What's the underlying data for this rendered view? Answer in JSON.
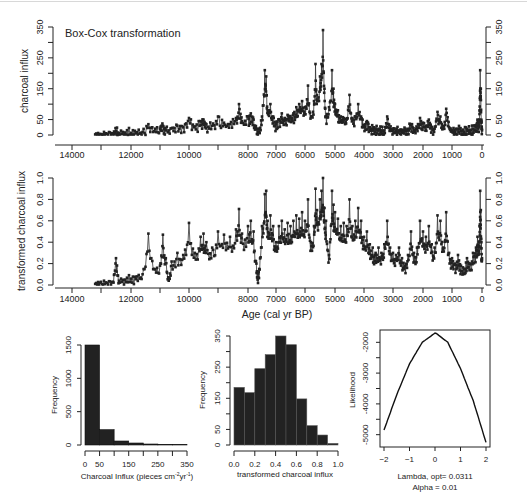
{
  "figure": {
    "title": "Box-Cox transformation"
  },
  "chart_data": [
    {
      "id": "raw-series",
      "type": "line",
      "title": "Box-Cox transformation",
      "xlabel": "",
      "ylabel": "charcoal influx",
      "xlim": [
        14500,
        0
      ],
      "ylim": [
        0,
        350
      ],
      "x_ticks": [
        14000,
        13000,
        12000,
        11000,
        10000,
        9000,
        8000,
        7000,
        6000,
        5000,
        4000,
        3000,
        2000,
        1000,
        0
      ],
      "x_tick_labels": [
        "14000",
        "12000",
        "10000",
        "8000",
        "7000",
        "6000",
        "5000",
        "4000",
        "3000",
        "2000",
        "1000",
        "0"
      ],
      "y_ticks": [
        0,
        50,
        100,
        150,
        200,
        250,
        300,
        350
      ],
      "y_tick_labels": [
        "0",
        "50",
        "150",
        "250",
        "350"
      ],
      "right_axis": true,
      "series": [
        {
          "name": "charcoal influx",
          "x": [
            13200,
            13000,
            12800,
            12600,
            12500,
            12400,
            12200,
            12000,
            11800,
            11600,
            11400,
            11200,
            11000,
            10900,
            10800,
            10600,
            10400,
            10200,
            10000,
            9800,
            9600,
            9500,
            9400,
            9200,
            9000,
            8800,
            8600,
            8400,
            8300,
            8200,
            8000,
            7900,
            7800,
            7700,
            7600,
            7500,
            7400,
            7350,
            7300,
            7200,
            7100,
            7000,
            6900,
            6800,
            6700,
            6600,
            6500,
            6400,
            6300,
            6200,
            6100,
            6000,
            5900,
            5800,
            5700,
            5650,
            5600,
            5500,
            5450,
            5400,
            5350,
            5300,
            5200,
            5100,
            5050,
            5000,
            4900,
            4800,
            4700,
            4600,
            4500,
            4400,
            4300,
            4200,
            4100,
            4000,
            3900,
            3800,
            3700,
            3600,
            3500,
            3400,
            3300,
            3200,
            3100,
            3000,
            2900,
            2800,
            2700,
            2600,
            2500,
            2400,
            2300,
            2200,
            2100,
            2000,
            1900,
            1800,
            1700,
            1600,
            1500,
            1400,
            1300,
            1200,
            1100,
            1000,
            900,
            800,
            700,
            600,
            500,
            400,
            300,
            200,
            150,
            100,
            80,
            60,
            40,
            20,
            0
          ],
          "y": [
            2,
            3,
            4,
            5,
            12,
            6,
            8,
            7,
            9,
            10,
            35,
            12,
            20,
            30,
            15,
            22,
            30,
            25,
            55,
            28,
            45,
            50,
            35,
            30,
            60,
            40,
            35,
            55,
            100,
            45,
            60,
            70,
            50,
            20,
            10,
            60,
            210,
            190,
            80,
            100,
            60,
            35,
            50,
            70,
            55,
            65,
            60,
            70,
            90,
            100,
            110,
            90,
            160,
            60,
            110,
            230,
            130,
            190,
            230,
            340,
            150,
            60,
            90,
            210,
            150,
            100,
            80,
            60,
            55,
            50,
            130,
            55,
            60,
            100,
            60,
            30,
            45,
            25,
            20,
            18,
            20,
            15,
            15,
            60,
            20,
            15,
            12,
            15,
            10,
            12,
            20,
            35,
            15,
            20,
            55,
            40,
            30,
            50,
            25,
            20,
            75,
            60,
            20,
            85,
            25,
            15,
            10,
            20,
            12,
            10,
            20,
            15,
            20,
            25,
            50,
            30,
            80,
            210,
            150,
            40,
            15
          ]
        }
      ]
    },
    {
      "id": "transformed-series",
      "type": "line",
      "title": "",
      "xlabel": "Age (cal yr BP)",
      "ylabel": "transformed charcoal influx",
      "xlim": [
        14500,
        0
      ],
      "ylim": [
        0,
        1
      ],
      "x_ticks": [
        14000,
        13000,
        12000,
        11000,
        10000,
        9000,
        8000,
        7000,
        6000,
        5000,
        4000,
        3000,
        2000,
        1000,
        0
      ],
      "x_tick_labels": [
        "14000",
        "12000",
        "10000",
        "8000",
        "7000",
        "6000",
        "5000",
        "4000",
        "3000",
        "2000",
        "1000",
        "0"
      ],
      "y_ticks": [
        0.0,
        0.2,
        0.4,
        0.6,
        0.8,
        1.0
      ],
      "y_tick_labels": [
        "0.0",
        "0.2",
        "0.4",
        "0.6",
        "0.8",
        "1.0"
      ],
      "right_axis": true,
      "series": [
        {
          "name": "transformed charcoal influx",
          "x": [
            13200,
            13000,
            12800,
            12600,
            12500,
            12400,
            12200,
            12000,
            11800,
            11600,
            11400,
            11200,
            11000,
            10900,
            10800,
            10700,
            10600,
            10400,
            10200,
            10000,
            9800,
            9600,
            9500,
            9400,
            9200,
            9000,
            8800,
            8600,
            8400,
            8300,
            8200,
            8000,
            7900,
            7800,
            7700,
            7650,
            7600,
            7500,
            7400,
            7350,
            7300,
            7200,
            7100,
            7000,
            6900,
            6800,
            6700,
            6600,
            6500,
            6400,
            6300,
            6200,
            6100,
            6000,
            5900,
            5800,
            5700,
            5650,
            5600,
            5500,
            5450,
            5400,
            5350,
            5300,
            5200,
            5100,
            5050,
            5000,
            4900,
            4800,
            4700,
            4600,
            4500,
            4400,
            4300,
            4200,
            4100,
            4000,
            3900,
            3800,
            3700,
            3600,
            3500,
            3400,
            3300,
            3200,
            3100,
            3000,
            2900,
            2800,
            2700,
            2600,
            2500,
            2400,
            2300,
            2200,
            2100,
            2000,
            1900,
            1800,
            1700,
            1600,
            1500,
            1400,
            1300,
            1200,
            1100,
            1000,
            900,
            800,
            700,
            600,
            500,
            400,
            300,
            200,
            150,
            100,
            80,
            60,
            40,
            20,
            0
          ],
          "y": [
            0.01,
            0.03,
            0.02,
            0.03,
            0.25,
            0.04,
            0.05,
            0.06,
            0.08,
            0.1,
            0.48,
            0.15,
            0.18,
            0.47,
            0.25,
            0.04,
            0.22,
            0.3,
            0.28,
            0.58,
            0.3,
            0.45,
            0.48,
            0.4,
            0.35,
            0.5,
            0.47,
            0.45,
            0.52,
            0.71,
            0.48,
            0.55,
            0.6,
            0.5,
            0.2,
            0.07,
            0.15,
            0.55,
            0.85,
            0.88,
            0.6,
            0.65,
            0.55,
            0.4,
            0.55,
            0.6,
            0.52,
            0.58,
            0.55,
            0.6,
            0.65,
            0.62,
            0.68,
            0.6,
            0.8,
            0.4,
            0.55,
            0.9,
            0.7,
            0.8,
            0.88,
            1.0,
            0.72,
            0.6,
            0.28,
            0.88,
            0.75,
            0.68,
            0.62,
            0.55,
            0.58,
            0.55,
            0.8,
            0.55,
            0.6,
            0.72,
            0.6,
            0.45,
            0.5,
            0.38,
            0.35,
            0.3,
            0.35,
            0.3,
            0.38,
            0.6,
            0.35,
            0.3,
            0.28,
            0.35,
            0.25,
            0.18,
            0.28,
            0.5,
            0.3,
            0.35,
            0.6,
            0.5,
            0.45,
            0.55,
            0.38,
            0.35,
            0.65,
            0.6,
            0.35,
            0.68,
            0.3,
            0.25,
            0.2,
            0.28,
            0.18,
            0.15,
            0.25,
            0.2,
            0.3,
            0.35,
            0.45,
            0.4,
            0.55,
            0.88,
            0.7,
            0.4,
            0.25
          ]
        }
      ]
    },
    {
      "id": "raw-histogram",
      "type": "bar",
      "title": "",
      "xlabel": "Charcoal Influx (pieces cm²yr¹)",
      "xlabel_main": "Charcoal Influx (pieces cm",
      "xlabel_sup1": "-2",
      "xlabel_mid": "yr",
      "xlabel_sup2": "-1",
      "xlabel_end": ")",
      "ylabel": "Frequency",
      "bin_edges": [
        0,
        50,
        100,
        150,
        200,
        250,
        300,
        350
      ],
      "values": [
        1500,
        230,
        60,
        30,
        15,
        8,
        5
      ],
      "x_tick_labels": [
        "0",
        "50",
        "150",
        "250",
        "350"
      ],
      "y_tick_labels": [
        "0",
        "500",
        "1000",
        "1500"
      ],
      "ylim": [
        0,
        1500
      ]
    },
    {
      "id": "transformed-histogram",
      "type": "bar",
      "title": "",
      "xlabel": "transformed charcoal influx",
      "ylabel": "Frequency",
      "bin_edges": [
        0.0,
        0.1,
        0.2,
        0.3,
        0.4,
        0.5,
        0.6,
        0.7,
        0.8,
        0.9,
        1.0
      ],
      "values": [
        185,
        168,
        245,
        290,
        350,
        322,
        148,
        62,
        32,
        5
      ],
      "x_tick_labels": [
        "0.0",
        "0.2",
        "0.4",
        "0.6",
        "0.8",
        "1.0"
      ],
      "y_tick_labels": [
        "0",
        "50",
        "150",
        "250",
        "350"
      ],
      "ylim": [
        0,
        350
      ]
    },
    {
      "id": "likelihood-curve",
      "type": "line",
      "title": "",
      "xlabel": "Lambda, opt= 0.0311",
      "subtitle": "Alpha = 0.01",
      "ylabel": "Likelihood",
      "xlim": [
        -2,
        2
      ],
      "ylim": [
        -5400,
        -1600
      ],
      "x_tick_labels": [
        "-2",
        "-1",
        "0",
        "1",
        "2"
      ],
      "y_tick_labels": [
        "-5000",
        "-4000",
        "-3000",
        "-2000"
      ],
      "series": [
        {
          "name": "log-likelihood",
          "x": [
            -2.0,
            -1.5,
            -1.0,
            -0.5,
            0.0,
            0.0311,
            0.5,
            1.0,
            1.5,
            2.0
          ],
          "y": [
            -4850,
            -3700,
            -2700,
            -2000,
            -1700,
            -1700,
            -2000,
            -2850,
            -3900,
            -5250
          ]
        }
      ]
    }
  ]
}
